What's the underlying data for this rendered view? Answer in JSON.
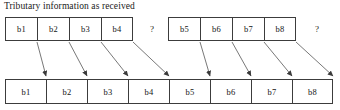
{
  "diagram": {
    "caption": "Tributary information as received",
    "background_color": "#ffffff",
    "line_color": "#3c3c3c",
    "arrow_color": "#444444",
    "text_color": "#141414",
    "top_row": {
      "label": "Tributary information as received",
      "groups": [
        {
          "name": "group-a",
          "cells": [
            {
              "label": "b1"
            },
            {
              "label": "b2"
            },
            {
              "label": "b3"
            },
            {
              "label": "b4"
            }
          ],
          "trailing_marker": "?"
        },
        {
          "name": "group-b",
          "cells": [
            {
              "label": "b5"
            },
            {
              "label": "b6"
            },
            {
              "label": "b7"
            },
            {
              "label": "b8"
            }
          ],
          "trailing_marker": "?"
        }
      ]
    },
    "bottom_row": {
      "cells": [
        {
          "label": "b1"
        },
        {
          "label": "b2"
        },
        {
          "label": "b3"
        },
        {
          "label": "b4"
        },
        {
          "label": "b5"
        },
        {
          "label": "b6"
        },
        {
          "label": "b7"
        },
        {
          "label": "b8"
        }
      ]
    },
    "mappings": [
      {
        "from": "b1",
        "to": "b1"
      },
      {
        "from": "b2",
        "to": "b2"
      },
      {
        "from": "b3",
        "to": "b3"
      },
      {
        "from": "b4",
        "to": "b4"
      },
      {
        "from": "b5",
        "to": "b5"
      },
      {
        "from": "b6",
        "to": "b6"
      },
      {
        "from": "b7",
        "to": "b7"
      },
      {
        "from": "b8",
        "to": "b8"
      }
    ]
  }
}
